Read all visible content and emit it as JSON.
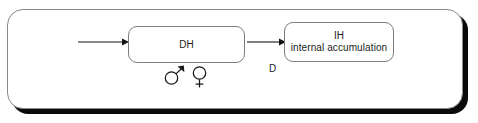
{
  "diagram": {
    "background_color": "#ffffff",
    "panel": {
      "border_color": "#8a8a8a",
      "shadow_color": "#0a0a0a",
      "fill_color": "#ffffff"
    },
    "nodes": [
      {
        "id": "dh",
        "title": "DH",
        "subtitle": "",
        "border_color": "#7d7d7d",
        "fill_color": "#ffffff"
      },
      {
        "id": "ih",
        "title": "IH",
        "subtitle": "internal accumulation",
        "border_color": "#7d7d7d",
        "fill_color": "#ffffff"
      }
    ],
    "arrows": [
      {
        "id": "arrow-in",
        "from": "",
        "to": "DH",
        "color": "#141414"
      },
      {
        "id": "arrow-mid",
        "from": "DH",
        "to": "IH",
        "color": "#141414"
      }
    ],
    "labels": [
      {
        "id": "label-d",
        "text": "D"
      }
    ],
    "symbols": [
      {
        "id": "male",
        "icon": "male-symbol",
        "character": "♂"
      },
      {
        "id": "female",
        "icon": "female-symbol",
        "character": "♀"
      }
    ]
  }
}
